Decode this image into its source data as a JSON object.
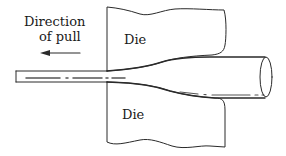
{
  "diagram": {
    "labels": {
      "direction_line1": "Direction",
      "direction_line2": "of pull",
      "upper_die": "Die",
      "lower_die": "Die"
    },
    "components": [
      {
        "id": "upper-die",
        "label": "Die"
      },
      {
        "id": "lower-die",
        "label": "Die"
      },
      {
        "id": "drawn-wire",
        "label": ""
      },
      {
        "id": "undrawn-rod",
        "label": ""
      },
      {
        "id": "pull-arrow",
        "label": "Direction of pull"
      }
    ],
    "colors": {
      "stroke": "#2a2a2a",
      "background": "#ffffff"
    }
  }
}
